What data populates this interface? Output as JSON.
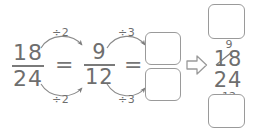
{
  "worksheet": {
    "title": "Fraction simplification worked example",
    "ink_color": "#6e6e6e",
    "background_color": "#ffffff",
    "equation": {
      "fraction_1": {
        "numerator": "18",
        "denominator": "24"
      },
      "equals_1": "=",
      "fraction_2": {
        "numerator": "9",
        "denominator": "12"
      },
      "equals_2": "=",
      "fraction_3": {
        "numerator": "",
        "denominator": ""
      }
    },
    "operations": {
      "step_1_top": "÷2",
      "step_1_bottom": "÷2",
      "step_2_top": "÷3",
      "step_2_bottom": "÷3"
    },
    "transition_arrow": "⇒",
    "worked_solution": {
      "box_above": "",
      "cancelled_numerator": "18",
      "numerator_replacement": "9",
      "cancelled_denominator": "24",
      "denominator_replacement": "12",
      "box_below": ""
    }
  }
}
